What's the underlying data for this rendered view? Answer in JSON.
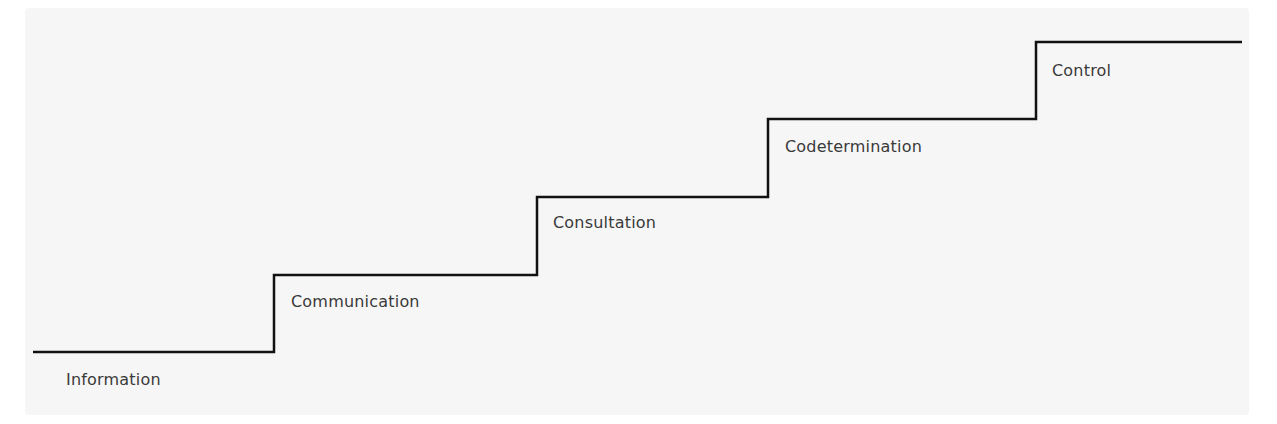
{
  "diagram": {
    "type": "staircase",
    "line_color": "#111111",
    "background_color": "#f6f6f6",
    "steps": [
      {
        "label": "Information",
        "level": 1
      },
      {
        "label": "Communication",
        "level": 2
      },
      {
        "label": "Consultation",
        "level": 3
      },
      {
        "label": "Codetermination",
        "level": 4
      },
      {
        "label": "Control",
        "level": 5
      }
    ]
  }
}
